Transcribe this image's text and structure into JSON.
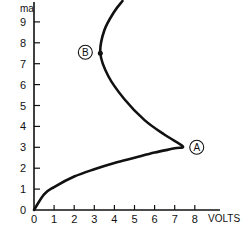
{
  "chart_data": {
    "type": "line",
    "title": "",
    "xlabel": "VOLTS",
    "ylabel": "ma",
    "xlim": [
      0,
      8.5
    ],
    "ylim": [
      0,
      10
    ],
    "x_ticks": [
      "0",
      "1",
      "2",
      "3",
      "4",
      "5",
      "6",
      "7",
      "8"
    ],
    "y_ticks": [
      "0",
      "1",
      "2",
      "3",
      "4",
      "5",
      "6",
      "7",
      "8",
      "9"
    ],
    "grid": false,
    "legend": null,
    "series": [
      {
        "name": "I-V curve",
        "points": [
          {
            "x": 0.0,
            "y": 0.0
          },
          {
            "x": 0.5,
            "y": 0.75
          },
          {
            "x": 1.0,
            "y": 1.1
          },
          {
            "x": 2.0,
            "y": 1.6
          },
          {
            "x": 3.0,
            "y": 1.95
          },
          {
            "x": 4.0,
            "y": 2.25
          },
          {
            "x": 5.0,
            "y": 2.5
          },
          {
            "x": 6.0,
            "y": 2.75
          },
          {
            "x": 7.0,
            "y": 2.95
          },
          {
            "x": 7.4,
            "y": 3.05
          },
          {
            "x": 6.5,
            "y": 3.6
          },
          {
            "x": 5.5,
            "y": 4.3
          },
          {
            "x": 4.5,
            "y": 5.3
          },
          {
            "x": 3.7,
            "y": 6.4
          },
          {
            "x": 3.3,
            "y": 7.5
          },
          {
            "x": 3.5,
            "y": 8.6
          },
          {
            "x": 4.0,
            "y": 9.5
          },
          {
            "x": 4.4,
            "y": 10.0
          }
        ]
      }
    ],
    "annotations": [
      {
        "label": "A",
        "x": 7.4,
        "y": 3.05
      },
      {
        "label": "B",
        "x": 3.3,
        "y": 7.5
      }
    ]
  }
}
